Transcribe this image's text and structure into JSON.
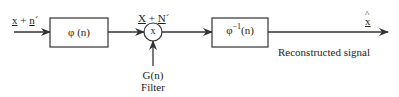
{
  "diagram": {
    "input_label": {
      "a": "x",
      "plus": " + ",
      "b": "n",
      "prime": "´"
    },
    "block1": {
      "label": "φ (n)"
    },
    "sum_label": {
      "a": "X",
      "plus": " + ",
      "b": "N",
      "prime": "´"
    },
    "multiplier": {
      "symbol": "x"
    },
    "filter": {
      "name": "G(n)",
      "caption": "Filter"
    },
    "block2": {
      "base": "φ",
      "exp": "−1",
      "arg": "(n)"
    },
    "output": {
      "hat": "^",
      "symbol": "x",
      "caption": "Reconstructed signal"
    },
    "colors": {
      "stroke": "#333333",
      "background": "#ffffff"
    }
  }
}
